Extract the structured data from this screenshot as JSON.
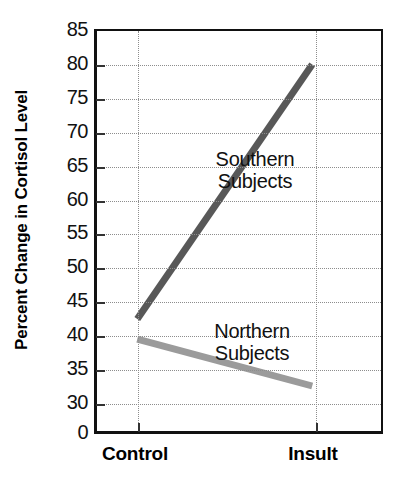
{
  "chart_data": {
    "type": "line",
    "title": "",
    "xlabel": "",
    "ylabel": "Percent Change in Cortisol Level",
    "categories": [
      "Control",
      "Insult"
    ],
    "x": [
      0,
      1
    ],
    "series": [
      {
        "name": "Southern Subjects",
        "values": [
          42,
          80
        ],
        "color": "#585858",
        "label_line1": "Southern",
        "label_line2": "Subjects"
      },
      {
        "name": "Northern Subjects",
        "values": [
          39,
          32
        ],
        "color": "#9b9b9b",
        "label_line1": "Northern",
        "label_line2": "Subjects"
      }
    ],
    "ylim": [
      30,
      85
    ],
    "yticks": [
      85,
      80,
      75,
      70,
      65,
      60,
      55,
      50,
      45,
      40,
      35,
      30
    ],
    "ytick_labels": [
      "85",
      "80",
      "75",
      "70",
      "65",
      "60",
      "55",
      "50",
      "45",
      "40",
      "35",
      "30"
    ],
    "axis_origin_label": "0",
    "grid": true,
    "grid_style": "dotted",
    "legend": "inline-annotations",
    "legend_position": "inside-right"
  },
  "axis": {
    "y_title": "Percent Change in Cortisol Level",
    "x_tick_control": "Control",
    "x_tick_insult": "Insult"
  },
  "colors": {
    "southern_line": "#585858",
    "northern_line": "#9b9b9b",
    "grid": "#8d8d8d",
    "frame": "#111111",
    "text": "#111111",
    "background": "#ffffff"
  }
}
